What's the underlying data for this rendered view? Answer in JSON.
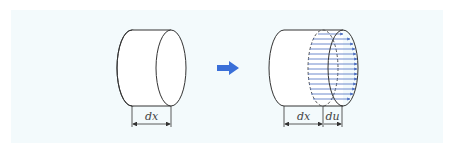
{
  "diagram": {
    "colors": {
      "background": "#f3fafc",
      "outline": "#333333",
      "arrow": "#3a6fd8",
      "flow_lines": "#4a6cc0"
    },
    "left_cylinder": {
      "label": "dx",
      "description": "Undeformed cylinder element of length dx"
    },
    "transition_arrow": {
      "icon": "right-arrow-icon"
    },
    "right_cylinder": {
      "labels": [
        "dx",
        "du"
      ],
      "description": "Deformed cylinder with displacement du shown by blue arrows"
    }
  }
}
